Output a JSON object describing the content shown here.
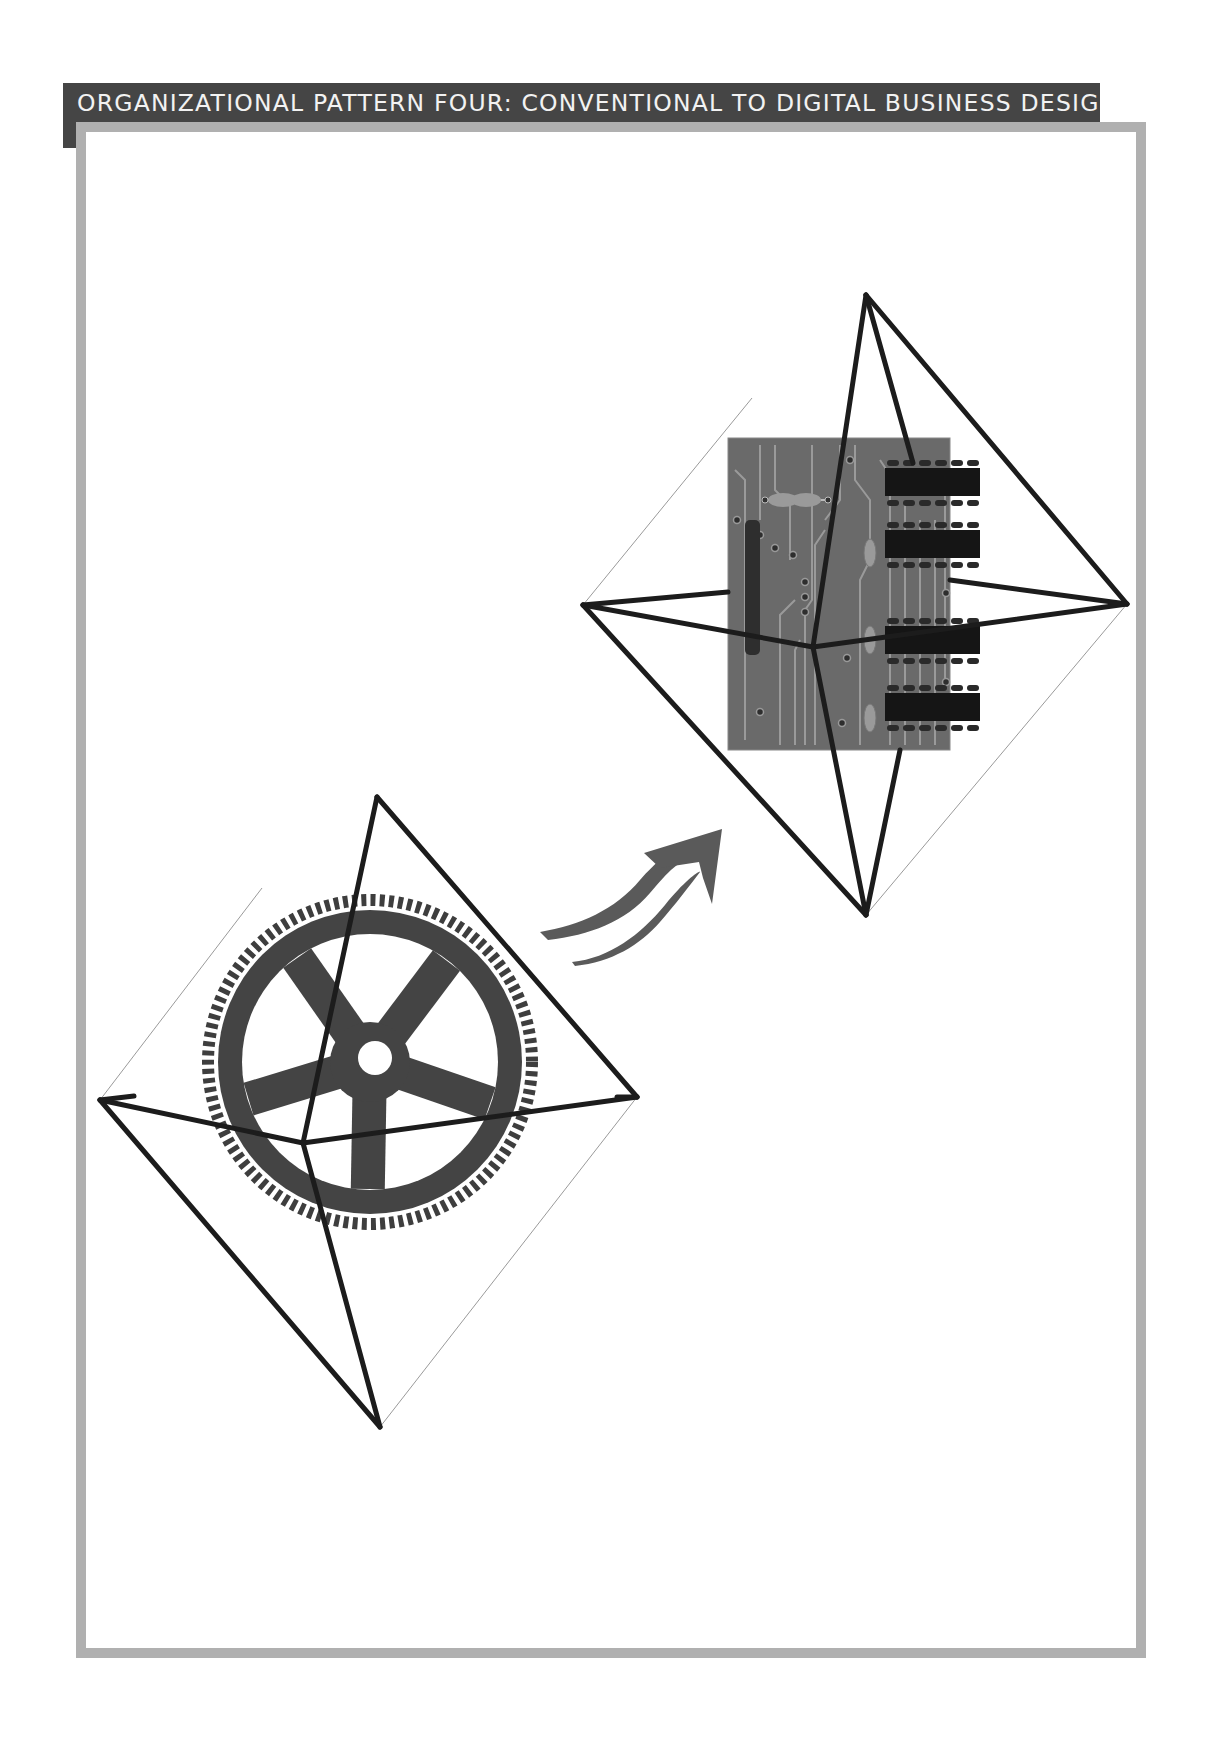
{
  "page": {
    "banner_title": "ORGANIZATIONAL PATTERN FOUR: CONVENTIONAL TO DIGITAL BUSINESS DESIGN"
  },
  "diagram": {
    "from": {
      "label": "Conventional",
      "image": "gear-icon",
      "shape": "octahedron-wireframe"
    },
    "transition": {
      "image": "double-curved-arrow-icon",
      "direction": "up-right"
    },
    "to": {
      "label": "Digital",
      "image": "circuit-board-icon",
      "shape": "octahedron-wireframe"
    }
  },
  "colors": {
    "banner_bg": "#454545",
    "banner_text": "#f2f2f2",
    "frame_border": "#b0b0b0",
    "wireframe": "#1c1c1c",
    "gear": "#3e3e3e",
    "circuit_board": "#6a6a6a",
    "arrow": "#5a5a5a"
  }
}
